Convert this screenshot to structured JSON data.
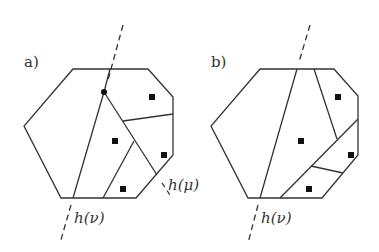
{
  "panels": [
    {
      "id": "a",
      "label": "a)",
      "point_label": "h(μ)",
      "line_label": "h(ν)"
    },
    {
      "id": "b",
      "label": "b)",
      "line_label": "h(ν)"
    }
  ],
  "colors": {
    "stroke": "#333333",
    "marker": "#111111",
    "background": "#ffffff"
  }
}
